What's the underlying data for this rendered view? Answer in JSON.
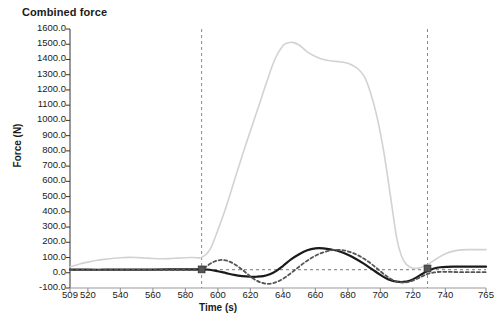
{
  "chart_data": {
    "type": "line",
    "title": "Combined force",
    "xlabel": "Time (s)",
    "ylabel": "Force (N)",
    "xlim": [
      509,
      765
    ],
    "ylim": [
      -100,
      1600
    ],
    "grid": false,
    "legend": "none",
    "ytick_labels": [
      "1600.0",
      "1500.0",
      "1400.0",
      "1300.0",
      "1200.0",
      "1100.0",
      "1000.0",
      "900.0",
      "800.0",
      "700.0",
      "600.0",
      "500.0",
      "400.0",
      "300.0",
      "200.0",
      "100.0",
      "0.0",
      "-100.0"
    ],
    "ytick_values": [
      1600,
      1500,
      1400,
      1300,
      1200,
      1100,
      1000,
      900,
      800,
      700,
      600,
      500,
      400,
      300,
      200,
      100,
      0,
      -100
    ],
    "xtick_labels": [
      "509",
      "520",
      "540",
      "560",
      "580",
      "600",
      "620",
      "640",
      "660",
      "680",
      "700",
      "720",
      "740",
      "765"
    ],
    "xtick_values": [
      509,
      520,
      540,
      560,
      580,
      600,
      620,
      640,
      660,
      680,
      700,
      720,
      740,
      765
    ],
    "annotations": {
      "vertical_markers": [
        590,
        729
      ],
      "horizontal_reference": 20,
      "marker_points": [
        {
          "x": 590,
          "y": 22
        },
        {
          "x": 729,
          "y": 28
        }
      ]
    },
    "series": [
      {
        "name": "total-combined-force",
        "style": "solid",
        "color": "#d2d2d2",
        "width": 1.6,
        "x": [
          509,
          515,
          520,
          525,
          530,
          535,
          540,
          545,
          550,
          555,
          560,
          565,
          570,
          575,
          580,
          585,
          590,
          595,
          600,
          605,
          610,
          615,
          620,
          625,
          630,
          635,
          640,
          643,
          646,
          650,
          655,
          660,
          665,
          670,
          675,
          680,
          683,
          686,
          690,
          694,
          698,
          702,
          706,
          710,
          713,
          716,
          720,
          725,
          730,
          735,
          740,
          745,
          750,
          755,
          760,
          765
        ],
        "y": [
          38,
          58,
          70,
          80,
          88,
          94,
          99,
          101,
          100,
          97,
          94,
          92,
          93,
          96,
          99,
          100,
          101,
          150,
          280,
          430,
          600,
          770,
          930,
          1090,
          1250,
          1400,
          1490,
          1508,
          1512,
          1495,
          1450,
          1420,
          1400,
          1390,
          1385,
          1375,
          1360,
          1340,
          1290,
          1180,
          1020,
          800,
          520,
          230,
          110,
          55,
          30,
          35,
          60,
          95,
          125,
          142,
          150,
          152,
          152,
          152
        ]
      },
      {
        "name": "force-component-solid-black",
        "style": "solid",
        "color": "#1a1a1a",
        "width": 2.2,
        "x": [
          509,
          515,
          520,
          530,
          540,
          550,
          560,
          570,
          580,
          585,
          590,
          595,
          600,
          605,
          610,
          615,
          620,
          624,
          628,
          632,
          636,
          640,
          645,
          650,
          655,
          660,
          665,
          670,
          675,
          680,
          685,
          690,
          695,
          700,
          705,
          710,
          714,
          718,
          722,
          726,
          729,
          733,
          737,
          741,
          745,
          750,
          755,
          760,
          765
        ],
        "y": [
          20,
          20,
          20,
          20,
          21,
          21,
          21,
          22,
          22,
          22,
          22,
          20,
          10,
          -2,
          -14,
          -22,
          -26,
          -26,
          -22,
          -10,
          12,
          44,
          88,
          122,
          148,
          160,
          160,
          152,
          140,
          118,
          90,
          58,
          22,
          -14,
          -44,
          -58,
          -60,
          -52,
          -32,
          -6,
          12,
          28,
          36,
          39,
          40,
          40,
          40,
          40,
          40
        ]
      },
      {
        "name": "force-component-dotted-gray",
        "style": "dotted",
        "color": "#555555",
        "width": 1.8,
        "x": [
          509,
          515,
          520,
          530,
          540,
          550,
          560,
          570,
          580,
          585,
          590,
          594,
          598,
          602,
          606,
          610,
          614,
          618,
          622,
          626,
          630,
          634,
          638,
          642,
          646,
          650,
          654,
          658,
          662,
          666,
          670,
          674,
          678,
          682,
          686,
          690,
          694,
          698,
          702,
          706,
          710,
          714,
          718,
          722,
          726,
          729,
          733,
          737,
          741,
          745,
          750,
          755,
          760,
          765
        ],
        "y": [
          18,
          18,
          18,
          18,
          18,
          18,
          18,
          18,
          18,
          18,
          20,
          50,
          74,
          84,
          78,
          58,
          28,
          -6,
          -40,
          -62,
          -72,
          -68,
          -52,
          -26,
          6,
          40,
          72,
          100,
          122,
          138,
          148,
          150,
          146,
          134,
          116,
          92,
          62,
          28,
          -8,
          -38,
          -58,
          -64,
          -58,
          -42,
          -22,
          -8,
          2,
          6,
          6,
          5,
          4,
          4,
          4,
          4
        ]
      }
    ]
  }
}
